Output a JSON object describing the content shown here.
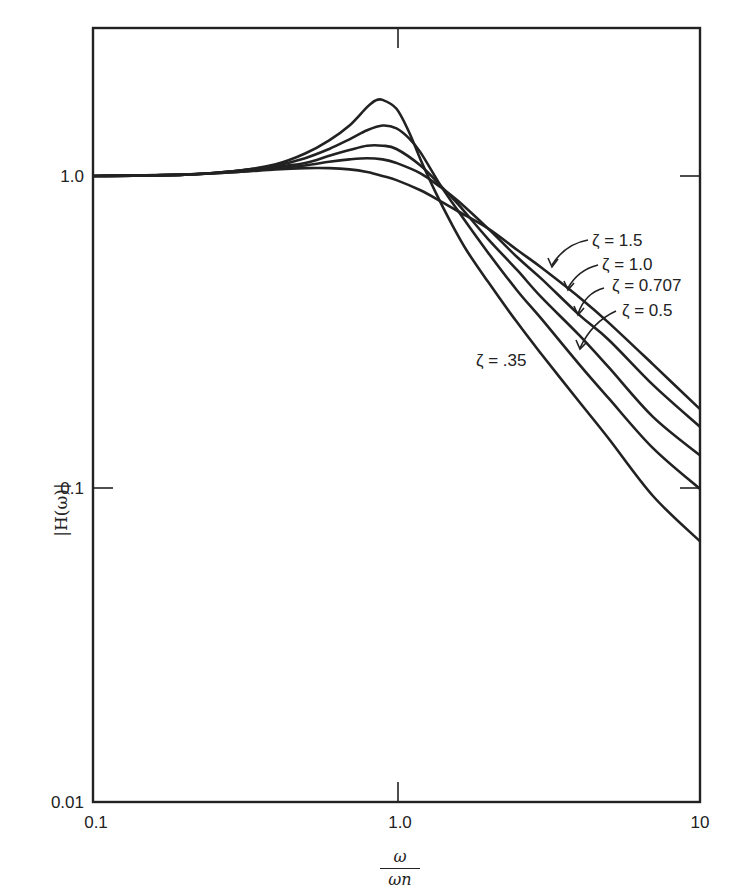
{
  "chart_data": {
    "type": "line",
    "title": "",
    "xlabel": "ω/ω_n",
    "ylabel": "|H(ω)|",
    "xscale": "log",
    "yscale": "log",
    "xlim": [
      0.1,
      10
    ],
    "ylim": [
      0.01,
      3
    ],
    "grid": false,
    "x_ticks": [
      {
        "value": 0.1,
        "label": "0.1"
      },
      {
        "value": 1.0,
        "label": "1.0"
      },
      {
        "value": 10,
        "label": "10"
      }
    ],
    "y_ticks": [
      {
        "value": 0.01,
        "label": "0.01"
      },
      {
        "value": 0.1,
        "label": "0.1"
      },
      {
        "value": 1.0,
        "label": "1.0"
      }
    ],
    "series": [
      {
        "name": "ζ = .35",
        "x": [
          0.1,
          0.2,
          0.3,
          0.4,
          0.5,
          0.6,
          0.7,
          0.8,
          0.85,
          0.9,
          1.0,
          1.1,
          1.2,
          1.35,
          1.5,
          1.7,
          2,
          2.5,
          3,
          4,
          5,
          7,
          10
        ],
        "values": [
          1.0,
          1.01,
          1.04,
          1.09,
          1.18,
          1.3,
          1.45,
          1.66,
          1.74,
          1.75,
          1.64,
          1.38,
          1.13,
          0.88,
          0.72,
          0.58,
          0.46,
          0.34,
          0.27,
          0.19,
          0.145,
          0.095,
          0.068
        ]
      },
      {
        "name": "ζ = 0.5",
        "x": [
          0.1,
          0.2,
          0.3,
          0.4,
          0.5,
          0.6,
          0.7,
          0.8,
          0.9,
          1.0,
          1.1,
          1.2,
          1.4,
          1.6,
          2,
          2.5,
          3,
          4,
          5,
          7,
          10
        ],
        "values": [
          1.0,
          1.01,
          1.04,
          1.08,
          1.14,
          1.22,
          1.31,
          1.4,
          1.45,
          1.42,
          1.32,
          1.19,
          0.93,
          0.77,
          0.57,
          0.43,
          0.35,
          0.25,
          0.195,
          0.135,
          0.1
        ]
      },
      {
        "name": "ζ = 0.707",
        "x": [
          0.1,
          0.2,
          0.3,
          0.4,
          0.5,
          0.6,
          0.7,
          0.8,
          0.9,
          1.0,
          1.2,
          1.4,
          1.6,
          2,
          2.5,
          3,
          4,
          5,
          7,
          10
        ],
        "values": [
          1.0,
          1.01,
          1.04,
          1.07,
          1.1,
          1.16,
          1.21,
          1.25,
          1.25,
          1.22,
          1.08,
          0.93,
          0.81,
          0.63,
          0.5,
          0.41,
          0.31,
          0.245,
          0.17,
          0.128
        ]
      },
      {
        "name": "ζ = 1.0",
        "x": [
          0.1,
          0.2,
          0.3,
          0.4,
          0.5,
          0.6,
          0.7,
          0.8,
          0.9,
          1.0,
          1.2,
          1.4,
          1.6,
          2,
          2.5,
          3,
          4,
          5,
          7,
          10
        ],
        "values": [
          1.0,
          1.01,
          1.03,
          1.06,
          1.08,
          1.11,
          1.13,
          1.14,
          1.13,
          1.1,
          1.02,
          0.92,
          0.83,
          0.68,
          0.55,
          0.47,
          0.36,
          0.3,
          0.215,
          0.158
        ]
      },
      {
        "name": "ζ = 1.5",
        "x": [
          0.1,
          0.2,
          0.3,
          0.4,
          0.5,
          0.6,
          0.7,
          0.8,
          0.9,
          1.0,
          1.2,
          1.4,
          1.6,
          2,
          2.5,
          3,
          4,
          5,
          7,
          10
        ],
        "values": [
          1.0,
          1.01,
          1.03,
          1.05,
          1.06,
          1.06,
          1.05,
          1.03,
          1.0,
          0.97,
          0.9,
          0.83,
          0.77,
          0.68,
          0.58,
          0.51,
          0.41,
          0.34,
          0.25,
          0.18
        ]
      }
    ],
    "annotations": [
      {
        "text": "ζ = 1.5",
        "target_series": "ζ = 1.5"
      },
      {
        "text": "ζ = 1.0",
        "target_series": "ζ = 1.0"
      },
      {
        "text": "ζ = 0.707",
        "target_series": "ζ = 0.707"
      },
      {
        "text": "ζ = 0.5",
        "target_series": "ζ = 0.5"
      },
      {
        "text": "ζ = .35",
        "target_series": "ζ = .35"
      }
    ],
    "legend": "none (inline arrow annotations)"
  },
  "axes": {
    "x_ticks": [
      "0.1",
      "1.0",
      "10"
    ],
    "y_ticks": [
      "0.01",
      "0.1",
      "1.0"
    ],
    "ylabel": "|H(ω)|",
    "xlabel_num": "ω",
    "xlabel_den": "ωn"
  },
  "labels": {
    "z15": "ζ = 1.5",
    "z10": "ζ = 1.0",
    "z0707": "ζ = 0.707",
    "z05": "ζ = 0.5",
    "z035": "ζ = .35"
  }
}
